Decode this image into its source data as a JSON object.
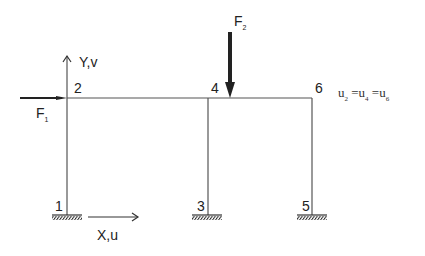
{
  "diagram": {
    "type": "portal frame structural diagram",
    "nodes": [
      {
        "id": "1",
        "label": "1"
      },
      {
        "id": "2",
        "label": "2"
      },
      {
        "id": "3",
        "label": "3"
      },
      {
        "id": "4",
        "label": "4"
      },
      {
        "id": "5",
        "label": "5"
      },
      {
        "id": "6",
        "label": "6"
      }
    ],
    "axes": {
      "y_label": "Y,v",
      "x_label": "X,u"
    },
    "forces": {
      "f1": {
        "base": "F",
        "sub": "1"
      },
      "f2": {
        "base": "F",
        "sub": "2"
      }
    },
    "constraint": {
      "u": "u",
      "s2": "2",
      "s4": "4",
      "s6": "6",
      "eq": "="
    },
    "colors": {
      "line": "#555555",
      "force": "#222222"
    }
  }
}
